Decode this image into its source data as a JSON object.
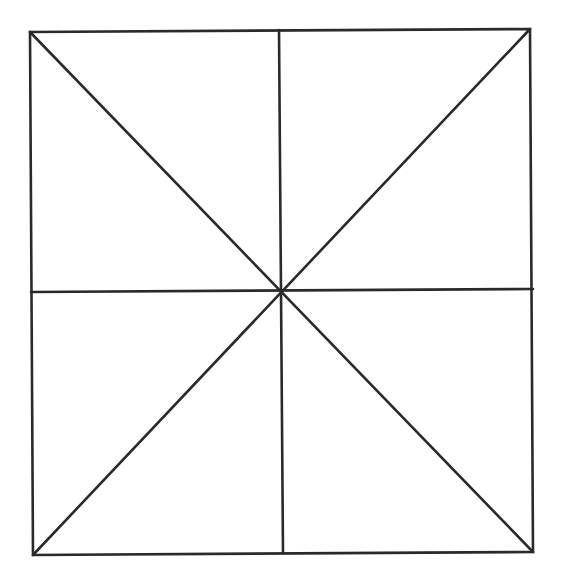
{
  "diagram": {
    "stroke_color": "#2a2a2a",
    "stroke_width": 2.6,
    "background": "#ffffff",
    "square": {
      "corners": {
        "top_left": [
          30,
          32
        ],
        "top_right": [
          530,
          29
        ],
        "bottom_right": [
          533,
          552
        ],
        "bottom_left": [
          33,
          555
        ]
      }
    },
    "center": [
      281,
      291
    ],
    "lines": [
      {
        "name": "diagonal-tl-br",
        "from": [
          30,
          32
        ],
        "to": [
          533,
          552
        ]
      },
      {
        "name": "diagonal-tr-bl",
        "from": [
          530,
          29
        ],
        "to": [
          33,
          555
        ]
      },
      {
        "name": "vertical-midline",
        "from": [
          279,
          30
        ],
        "to": [
          283,
          553
        ]
      },
      {
        "name": "horizontal-midline",
        "from": [
          31,
          292
        ],
        "to": [
          533,
          289
        ]
      }
    ]
  }
}
